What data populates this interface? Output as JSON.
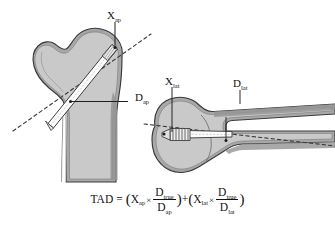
{
  "figure": {
    "background_color": "#ffffff",
    "bone_fill_color": "#c9c9c9",
    "cortex_fill_color": "#a8a8a8",
    "outline_color": "#3a3a3a",
    "implant_fill_color": "#f2f2f2",
    "label_color": "#111111"
  },
  "panels": {
    "ap": {
      "name": "anteroposterior-view",
      "caption": "AP view of proximal femur with lag screw",
      "labels": {
        "x_ap": {
          "base": "X",
          "sub": "ap"
        },
        "d_ap": {
          "base": "D",
          "sub": "ap"
        }
      }
    },
    "lateral": {
      "name": "lateral-view",
      "caption": "Lateral view of proximal femur with lag screw",
      "labels": {
        "x_lat": {
          "base": "X",
          "sub": "lat"
        },
        "d_lat": {
          "base": "D",
          "sub": "lat"
        }
      }
    }
  },
  "formula": {
    "lhs": "TAD",
    "equals": "=",
    "open_paren": "(",
    "close_paren": ")",
    "plus": "+",
    "times": "×",
    "term1": {
      "x_base": "X",
      "x_sub": "ap",
      "num_base": "D",
      "num_sub": "true",
      "den_base": "D",
      "den_sub": "ap"
    },
    "term2": {
      "x_base": "X",
      "x_sub": "lat",
      "num_base": "D",
      "num_sub": "true",
      "den_base": "D",
      "den_sub": "lat"
    }
  }
}
